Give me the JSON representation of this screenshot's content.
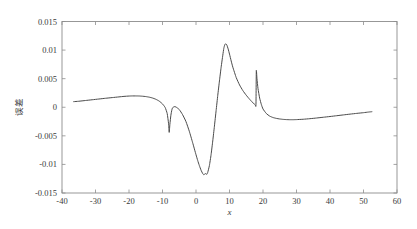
{
  "figure": {
    "background_color": "#ffffff",
    "frame_color": "#8d8d8d",
    "curve_color": "#4a4a4a"
  },
  "chart_data": {
    "type": "line",
    "title": "",
    "subtitle": "",
    "xlabel": "x",
    "ylabel": "误差",
    "xlim": [
      -40,
      60
    ],
    "ylim": [
      -0.015,
      0.015
    ],
    "grid": false,
    "legend": [],
    "legend_position": "none",
    "xticks": [
      -40,
      -30,
      -20,
      -10,
      0,
      10,
      20,
      30,
      40,
      50,
      60
    ],
    "xtick_labels": [
      "-40",
      "-30",
      "-20",
      "-10",
      "0",
      "10",
      "20",
      "30",
      "40",
      "50",
      "60"
    ],
    "yticks": [
      0.015,
      0.01,
      0.005,
      0,
      -0.005,
      -0.01,
      -0.015
    ],
    "ytick_labels": [
      "0.015",
      "0.01",
      "0.005",
      "0",
      "-0.005",
      "-0.01",
      "-0.015"
    ],
    "series": [
      {
        "name": "误差",
        "x": [
          -36.5,
          -35.0,
          -33.0,
          -31.0,
          -29.0,
          -27.0,
          -25.0,
          -23.0,
          -21.5,
          -20.0,
          -19.0,
          -18.0,
          -17.0,
          -16.0,
          -15.0,
          -14.0,
          -13.0,
          -12.0,
          -11.0,
          -10.0,
          -9.2,
          -8.6,
          -8.2,
          -8.0,
          -7.8,
          -7.5,
          -7.2,
          -7.0,
          -6.5,
          -6.0,
          -5.0,
          -4.0,
          -3.0,
          -2.0,
          -1.0,
          0.0,
          0.5,
          1.0,
          1.5,
          2.0,
          2.3,
          2.6,
          2.9,
          3.2,
          3.5,
          4.0,
          4.5,
          5.0,
          5.5,
          6.0,
          6.5,
          7.0,
          7.5,
          8.0,
          8.3,
          8.6,
          8.9,
          9.2,
          9.6,
          10.0,
          10.5,
          11.0,
          12.0,
          13.0,
          14.0,
          15.0,
          16.0,
          16.8,
          17.4,
          17.7,
          17.9,
          18.0,
          18.2,
          18.5,
          19.0,
          19.5,
          20.0,
          21.0,
          22.0,
          23.0,
          24.0,
          25.0,
          26.0,
          27.0,
          28.0,
          29.0,
          30.0,
          32.0,
          34.0,
          36.0,
          38.0,
          40.0,
          42.0,
          44.0,
          46.0,
          48.0,
          50.0,
          51.5,
          52.5
        ],
        "y": [
          0.00098,
          0.00105,
          0.00118,
          0.00131,
          0.00144,
          0.00157,
          0.00169,
          0.00181,
          0.0019,
          0.00196,
          0.00198,
          0.00198,
          0.00197,
          0.00193,
          0.00187,
          0.00177,
          0.00162,
          0.0014,
          0.00108,
          0.00058,
          -5e-05,
          -0.0011,
          -0.0028,
          -0.0044,
          -0.003,
          -0.0014,
          -0.00045,
          -0.0001,
          0.0001,
          5e-05,
          -0.0004,
          -0.0013,
          -0.0025,
          -0.0042,
          -0.0062,
          -0.0083,
          -0.0093,
          -0.0102,
          -0.011,
          -0.0116,
          -0.0118,
          -0.0117,
          -0.0116,
          -0.01175,
          -0.0114,
          -0.0102,
          -0.0083,
          -0.0059,
          -0.0033,
          -0.0006,
          0.0021,
          0.0046,
          0.007,
          0.0091,
          0.0103,
          0.01095,
          0.0111,
          0.0109,
          0.0102,
          0.0093,
          0.0081,
          0.007,
          0.0052,
          0.0039,
          0.0029,
          0.0021,
          0.0014,
          0.0009,
          0.00055,
          0.0004,
          0.00035,
          0.0064,
          0.005,
          0.0033,
          0.0016,
          0.0005,
          -0.0003,
          -0.0011,
          -0.00155,
          -0.0018,
          -0.00195,
          -0.00205,
          -0.00212,
          -0.00216,
          -0.00218,
          -0.00218,
          -0.00216,
          -0.0021,
          -0.002,
          -0.00188,
          -0.00175,
          -0.00162,
          -0.00148,
          -0.00134,
          -0.0012,
          -0.00107,
          -0.00095,
          -0.00084,
          -0.00078
        ],
        "color": "#4a4a4a"
      }
    ],
    "annotations": []
  }
}
